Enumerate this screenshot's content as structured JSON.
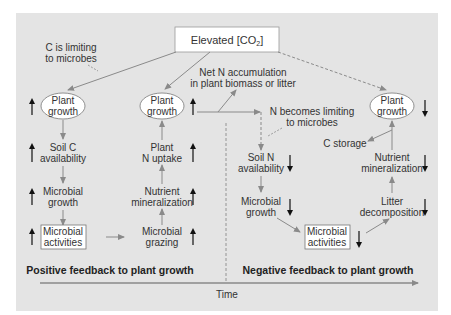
{
  "title": "Elevated [CO2]",
  "title_parts": {
    "prefix": "Elevated [CO",
    "sub": "2",
    "suffix": "]"
  },
  "annotations": {
    "c_limiting": [
      "C is limiting",
      "to microbes"
    ],
    "net_n": [
      "Net N accumulation",
      "in plant biomass or litter"
    ],
    "n_limiting": [
      "N becomes limiting",
      "to microbes"
    ]
  },
  "positive_branch": {
    "left_column": [
      {
        "lines": [
          "Plant",
          "growth"
        ],
        "shape": "ellipse",
        "trend": "up"
      },
      {
        "lines": [
          "Soil C",
          "availability"
        ],
        "shape": "text",
        "trend": "up"
      },
      {
        "lines": [
          "Microbial",
          "growth"
        ],
        "shape": "text",
        "trend": "up"
      },
      {
        "lines": [
          "Microbial",
          "activities"
        ],
        "shape": "box",
        "trend": "up"
      }
    ],
    "right_column": [
      {
        "lines": [
          "Plant",
          "growth"
        ],
        "shape": "ellipse",
        "trend": "up"
      },
      {
        "lines": [
          "Plant",
          "N uptake"
        ],
        "shape": "text",
        "trend": "up"
      },
      {
        "lines": [
          "Nutrient",
          "mineralization"
        ],
        "shape": "text",
        "trend": "up"
      },
      {
        "lines": [
          "Microbial",
          "grazing"
        ],
        "shape": "text",
        "trend": "up"
      }
    ],
    "footer": "Positive feedback to plant growth"
  },
  "negative_branch": {
    "left_column": [
      {
        "lines": [
          "Soil N",
          "availability"
        ],
        "shape": "text",
        "trend": "down"
      },
      {
        "lines": [
          "Microbial",
          "growth"
        ],
        "shape": "text",
        "trend": "down"
      }
    ],
    "center": {
      "lines": [
        "Microbial",
        "activities"
      ],
      "shape": "box",
      "trend": "down"
    },
    "right_column": [
      {
        "lines": [
          "Plant",
          "growth"
        ],
        "shape": "ellipse",
        "trend": "down"
      },
      {
        "lines": [
          "C storage"
        ],
        "shape": "text"
      },
      {
        "lines": [
          "Nutrient",
          "mineralization"
        ],
        "shape": "text",
        "trend": "down"
      },
      {
        "lines": [
          "Litter",
          "decomposition"
        ],
        "shape": "text",
        "trend": "down"
      }
    ],
    "footer": "Negative feedback to plant growth"
  },
  "axis": {
    "label": "Time"
  },
  "colors": {
    "panel": "#e4e4e4",
    "arrow": "#8a8a8a",
    "text": "#333333",
    "trend_arrow": "#111111",
    "box": "#ffffff"
  }
}
